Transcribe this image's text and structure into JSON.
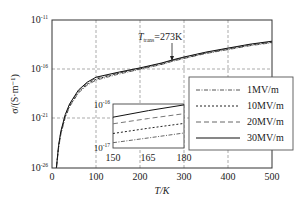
{
  "chart_data": {
    "type": "line",
    "title": "",
    "xlabel": "T/K",
    "ylabel": "σ/(S·m⁻¹)",
    "xlim": [
      0,
      500
    ],
    "ylim_log10": [
      -26,
      -11
    ],
    "y_scale": "log",
    "x_ticks": [
      "0",
      "100",
      "200",
      "300",
      "400",
      "500"
    ],
    "y_ticks": [
      {
        "base": "10",
        "exp": "-11"
      },
      {
        "base": "10",
        "exp": "-16"
      },
      {
        "base": "10",
        "exp": "-21"
      },
      {
        "base": "10",
        "exp": "-26"
      }
    ],
    "grid": "dashed",
    "annotation": {
      "text_main": "T",
      "text_sub": "trans",
      "text_rest": "=273K",
      "x": 273
    },
    "legend_position": "right-middle",
    "x": [
      10,
      15,
      20,
      30,
      40,
      60,
      80,
      100,
      150,
      200,
      250,
      273,
      300,
      350,
      400,
      450,
      500
    ],
    "series": [
      {
        "name": "1MV/m",
        "style": "dash-dot",
        "log10_values": [
          -26.0,
          -24.0,
          -22.6,
          -20.9,
          -19.8,
          -18.4,
          -17.6,
          -17.1,
          -16.5,
          -16.0,
          -15.5,
          -15.2,
          -14.9,
          -14.4,
          -14.0,
          -13.6,
          -13.3
        ]
      },
      {
        "name": "10MV/m",
        "style": "dotted",
        "log10_values": [
          -26.0,
          -23.9,
          -22.5,
          -20.8,
          -19.7,
          -18.3,
          -17.5,
          -17.0,
          -16.4,
          -15.95,
          -15.45,
          -15.15,
          -14.85,
          -14.35,
          -13.95,
          -13.55,
          -13.25
        ]
      },
      {
        "name": "20MV/m",
        "style": "dashed",
        "log10_values": [
          -26.0,
          -23.8,
          -22.4,
          -20.7,
          -19.6,
          -18.2,
          -17.4,
          -16.9,
          -16.35,
          -15.9,
          -15.4,
          -15.1,
          -14.8,
          -14.3,
          -13.9,
          -13.5,
          -13.2
        ]
      },
      {
        "name": "30MV/m",
        "style": "solid",
        "log10_values": [
          -26.0,
          -23.7,
          -22.3,
          -20.6,
          -19.5,
          -18.1,
          -17.3,
          -16.8,
          -16.3,
          -15.85,
          -15.35,
          -15.05,
          -14.75,
          -14.25,
          -13.85,
          -13.45,
          -13.15
        ]
      }
    ],
    "inset": {
      "xlim": [
        150,
        180
      ],
      "ylim_log10": [
        -17,
        -16
      ],
      "x_ticks": [
        "150",
        "165",
        "180"
      ],
      "y_ticks": [
        {
          "base": "10",
          "exp": "-16"
        },
        {
          "base": "10",
          "exp": "-17"
        }
      ],
      "x": [
        150,
        165,
        180
      ],
      "series": [
        {
          "name": "1MV/m",
          "log10_values": [
            -16.88,
            -16.77,
            -16.66
          ]
        },
        {
          "name": "10MV/m",
          "log10_values": [
            -16.67,
            -16.55,
            -16.44
          ]
        },
        {
          "name": "20MV/m",
          "log10_values": [
            -16.45,
            -16.33,
            -16.22
          ]
        },
        {
          "name": "30MV/m",
          "log10_values": [
            -16.3,
            -16.15,
            -16.02
          ]
        }
      ]
    }
  }
}
